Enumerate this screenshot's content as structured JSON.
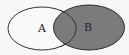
{
  "diagram": {
    "type": "venn",
    "sets": [
      {
        "id": "A",
        "label": "A",
        "fill": "#f9f9f9",
        "stroke": "#333333",
        "shaded": false
      },
      {
        "id": "B",
        "label": "B",
        "fill": "#7b7b7b",
        "stroke": "#2a2a2a",
        "shaded": true
      }
    ],
    "shaded_region": "B (including A∩B)",
    "background": "#f7f7f7"
  }
}
